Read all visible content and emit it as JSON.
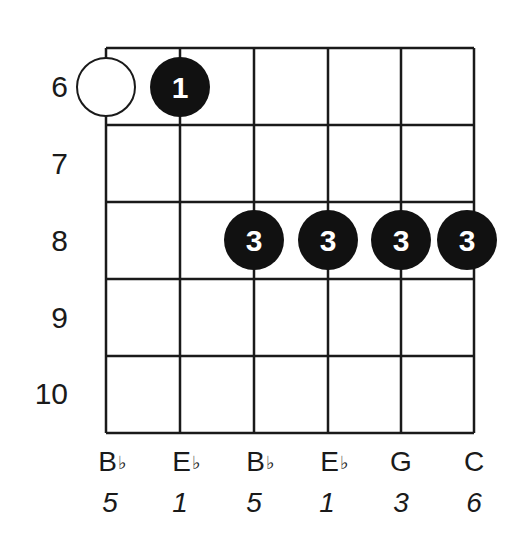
{
  "chart": {
    "frets": [
      "6",
      "7",
      "8",
      "9",
      "10"
    ],
    "strings": [
      {
        "note": "B",
        "accidental": "♭",
        "interval": "5"
      },
      {
        "note": "E",
        "accidental": "♭",
        "interval": "1"
      },
      {
        "note": "B",
        "accidental": "♭",
        "interval": "5"
      },
      {
        "note": "E",
        "accidental": "♭",
        "interval": "1"
      },
      {
        "note": "G",
        "accidental": "",
        "interval": "3"
      },
      {
        "note": "C",
        "accidental": "",
        "interval": "6"
      }
    ],
    "markers": [
      {
        "string": 1,
        "fret": "6",
        "type": "open-circle",
        "finger": ""
      },
      {
        "string": 2,
        "fret": "6",
        "type": "filled",
        "finger": "1"
      },
      {
        "string": 3,
        "fret": "8",
        "type": "filled",
        "finger": "3"
      },
      {
        "string": 4,
        "fret": "8",
        "type": "filled",
        "finger": "3"
      },
      {
        "string": 5,
        "fret": "8",
        "type": "filled",
        "finger": "3"
      },
      {
        "string": 6,
        "fret": "8",
        "type": "filled",
        "finger": "3"
      }
    ],
    "colors": {
      "line": "#1a1a1a",
      "dot": "#111111",
      "dot_text": "#ffffff",
      "background": "#ffffff"
    }
  }
}
